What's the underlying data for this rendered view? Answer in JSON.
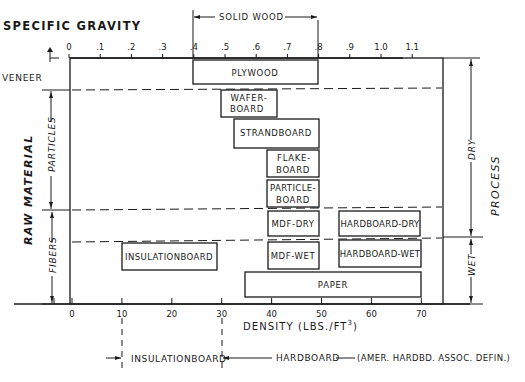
{
  "top_axis": {
    "title": "SPECIFIC GRAVITY",
    "ticks": [
      "0",
      ".1",
      ".2",
      ".3",
      ".4",
      ".5",
      ".6",
      ".7",
      ".8",
      ".9",
      "1.0",
      "1.1"
    ],
    "solid_wood_label": "SOLID WOOD",
    "solid_wood_range": [
      0.4,
      0.8
    ]
  },
  "bottom_axis": {
    "title": "DENSITY (LBS./FT",
    "title_sup": "3",
    "title_close": ")",
    "ticks": [
      "0",
      "10",
      "20",
      "30",
      "40",
      "50",
      "60",
      "70"
    ]
  },
  "left_axis": {
    "title": "RAW MATERIAL",
    "zones": [
      "VENEER",
      "PARTICLES",
      "FIBERS"
    ]
  },
  "right_axis": {
    "title": "PROCESS",
    "zones": [
      "DRY",
      "WET"
    ]
  },
  "products": [
    {
      "name": "plywood",
      "lines": [
        "PLYWOOD"
      ],
      "density": [
        24,
        50
      ]
    },
    {
      "name": "waferboard",
      "lines": [
        "WAFER-",
        "BOARD"
      ],
      "density": [
        30,
        41
      ]
    },
    {
      "name": "strandboard",
      "lines": [
        "STRANDBOARD"
      ],
      "density": [
        33,
        50
      ]
    },
    {
      "name": "flakeboard",
      "lines": [
        "FLAKE-",
        "BOARD"
      ],
      "density": [
        40,
        50
      ]
    },
    {
      "name": "particleboard",
      "lines": [
        "PARTICLE-",
        "BOARD"
      ],
      "density": [
        40,
        50
      ]
    },
    {
      "name": "mdf-dry",
      "lines": [
        "MDF-DRY"
      ],
      "density": [
        40,
        50
      ]
    },
    {
      "name": "hardboard-dry",
      "lines": [
        "HARDBOARD-DRY"
      ],
      "density": [
        54,
        70
      ]
    },
    {
      "name": "insulationboard",
      "lines": [
        "INSULATIONBOARD"
      ],
      "density": [
        10,
        29
      ]
    },
    {
      "name": "mdf-wet",
      "lines": [
        "MDF-WET"
      ],
      "density": [
        40,
        50
      ]
    },
    {
      "name": "hardboard-wet",
      "lines": [
        "HARDBOARD-WET"
      ],
      "density": [
        54,
        70
      ]
    },
    {
      "name": "paper",
      "lines": [
        "PAPER"
      ],
      "density": [
        35,
        70
      ]
    }
  ],
  "definitions": {
    "insulationboard_label": "INSULATIONBOARD",
    "insulationboard_range": [
      10,
      30
    ],
    "hardboard_label": "HARDBOARD",
    "hardboard_note": "(AMER. HARDBD. ASSOC. DEFIN.)"
  }
}
